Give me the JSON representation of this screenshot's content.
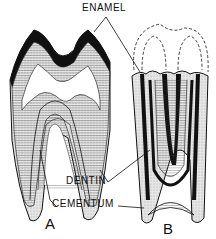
{
  "diagram": {
    "labels": {
      "enamel": "ENAMEL",
      "dentin": "DENTIN",
      "cementum": "CEMENTUM",
      "tooth_a": "A",
      "tooth_b": "B"
    },
    "colors": {
      "ink": "#111111",
      "background": "#ffffff",
      "stipple": "#cfcfcf"
    }
  }
}
